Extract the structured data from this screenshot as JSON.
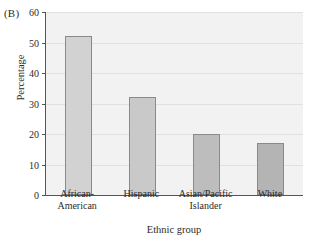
{
  "figure": {
    "panel_label": "(B)",
    "ylabel": "Percentage",
    "xlabel": "Ethnic group"
  },
  "chart_data": {
    "type": "bar",
    "title": "",
    "panel": "(B)",
    "xlabel": "Ethnic group",
    "ylabel": "Percentage",
    "categories": [
      "African-American",
      "Hispanic",
      "Asian/Pacific Islander",
      "White"
    ],
    "category_lines": [
      [
        "African-",
        "American"
      ],
      [
        "Hispanic"
      ],
      [
        "Asian/Pacific",
        "Islander"
      ],
      [
        "White"
      ]
    ],
    "values": [
      52,
      32,
      20,
      17
    ],
    "ylim": [
      0,
      60
    ],
    "yticks": [
      0,
      10,
      20,
      30,
      40,
      50,
      60
    ],
    "ytick_labels": [
      "0",
      "10",
      "20",
      "30",
      "40",
      "50",
      "60"
    ],
    "grid": true,
    "legend": null,
    "bar_colors": [
      "#d2d2d2",
      "#c9c9c9",
      "#bdbdbd",
      "#b4b4b4"
    ],
    "bar_edge_color": "#8a8a8a",
    "plot_background": "#f2f2f2",
    "axis_color": "#555555"
  }
}
